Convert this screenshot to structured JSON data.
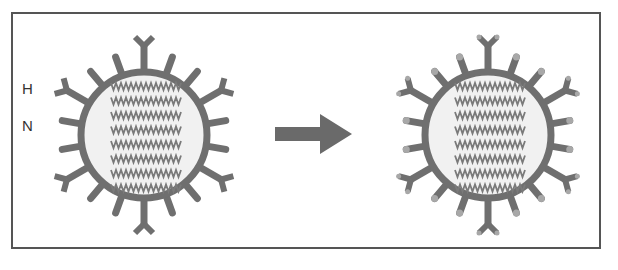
{
  "diagram": {
    "labels": {
      "hemagglutinin": "H",
      "neuraminidase": "N"
    },
    "colors": {
      "spike": "#6f6f6f",
      "envelope": "#6f6f6f",
      "core": "#f1f1f1",
      "rna": "#7a7a7a",
      "altered_tip": "#a8a8a8",
      "arrow": "#6a6a6a",
      "frame": "#555555"
    },
    "nodes": [
      {
        "id": "virus-before",
        "label": "original virus",
        "spikes": 18,
        "rna_rows": 8
      },
      {
        "id": "virus-after",
        "label": "mutated virus",
        "spikes": 18,
        "rna_rows": 8,
        "altered_spike_tips": true
      }
    ],
    "edges": [
      {
        "from": "virus-before",
        "to": "virus-after",
        "type": "arrow"
      }
    ]
  }
}
